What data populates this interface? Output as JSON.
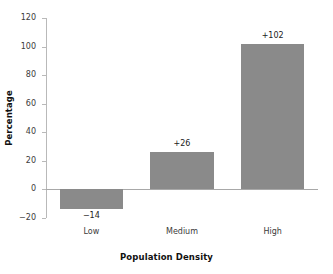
{
  "chart_data": {
    "type": "bar",
    "title": "",
    "subtitle": "",
    "categories": [
      "Low",
      "Medium",
      "High"
    ],
    "values": [
      -14,
      26,
      102
    ],
    "data_labels": [
      "−14",
      "+26",
      "+102"
    ],
    "xlabel": "Population Density",
    "ylabel": "Percentage",
    "ylim": [
      -20,
      120
    ],
    "yticks": [
      -20,
      0,
      20,
      40,
      60,
      80,
      100,
      120
    ],
    "ytick_labels": [
      "−20",
      "0",
      "20",
      "40",
      "60",
      "80",
      "100",
      "120"
    ],
    "grid": false,
    "legend": false,
    "legend_position": "none",
    "bar_color": "#8a8a8a",
    "axis_color": "#b9b9b9",
    "zero_line_color": "#a8a8a8",
    "background": "#ffffff"
  }
}
